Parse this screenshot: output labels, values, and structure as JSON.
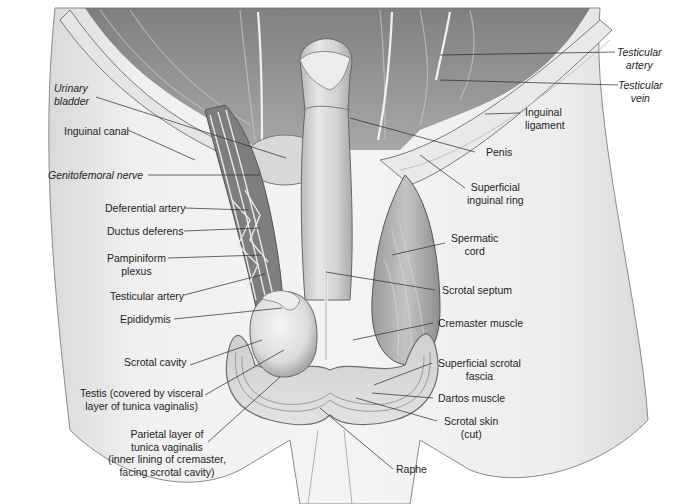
{
  "figure": {
    "style": "grayscale anatomical illustration"
  },
  "labels_left": [
    {
      "id": "urinary-bladder",
      "text": "Urinary\nbladder",
      "italic": true
    },
    {
      "id": "inguinal-canal",
      "text": "Inguinal canal",
      "italic": false
    },
    {
      "id": "genitofemoral-nerve",
      "text": "Genitofemoral nerve",
      "italic": true
    },
    {
      "id": "deferential-artery",
      "text": "Deferential artery",
      "italic": false
    },
    {
      "id": "ductus-deferens",
      "text": "Ductus deferens",
      "italic": false
    },
    {
      "id": "pampiniform-plexus",
      "text": "Pampiniform\nplexus",
      "italic": false
    },
    {
      "id": "testicular-artery-left",
      "text": "Testicular artery",
      "italic": false
    },
    {
      "id": "epididymis",
      "text": "Epididymis",
      "italic": false
    },
    {
      "id": "scrotal-cavity",
      "text": "Scrotal cavity",
      "italic": false
    },
    {
      "id": "testis",
      "text": "Testis (covered by visceral\nlayer of tunica vaginalis)",
      "italic": false
    },
    {
      "id": "parietal-layer",
      "text": "Parietal layer of\ntunica vaginalis\n(inner lining of cremaster,\nfacing scrotal cavity)",
      "italic": false
    }
  ],
  "labels_right": [
    {
      "id": "testicular-artery-right",
      "text": "Testicular\nartery",
      "italic": true
    },
    {
      "id": "testicular-vein",
      "text": "Testicular\nvein",
      "italic": true
    },
    {
      "id": "inguinal-ligament",
      "text": "Inguinal\nligament",
      "italic": false
    },
    {
      "id": "penis",
      "text": "Penis",
      "italic": false
    },
    {
      "id": "superficial-inguinal-ring",
      "text": "Superficial\ninguinal ring",
      "italic": false
    },
    {
      "id": "spermatic-cord",
      "text": "Spermatic\ncord",
      "italic": false
    },
    {
      "id": "scrotal-septum",
      "text": "Scrotal septum",
      "italic": false
    },
    {
      "id": "cremaster-muscle",
      "text": "Cremaster muscle",
      "italic": false
    },
    {
      "id": "superficial-scrotal-fascia",
      "text": "Superficial scrotal\nfascia",
      "italic": false
    },
    {
      "id": "dartos-muscle",
      "text": "Dartos muscle",
      "italic": false
    },
    {
      "id": "scrotal-skin",
      "text": "Scrotal skin\n(cut)",
      "italic": false
    },
    {
      "id": "raphe",
      "text": "Raphe",
      "italic": false
    }
  ],
  "colors": {
    "background": "#ffffff",
    "skin": "#e4e4e4",
    "skin_shadow": "#bdbdbd",
    "muscle": "#8f8f8f",
    "dark": "#5a5a5a",
    "outline": "#555555",
    "leader_line": "#2a2a2a",
    "label_text": "#1e1e1e"
  }
}
